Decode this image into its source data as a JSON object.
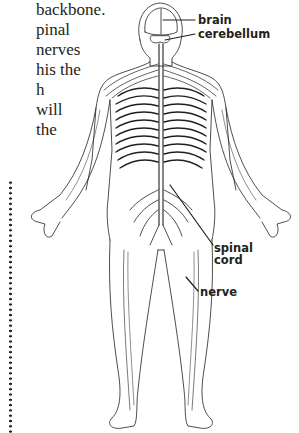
{
  "body_text": {
    "lines": [
      "backbone.",
      "pinal",
      "nerves",
      "his the",
      "h",
      "will",
      "the"
    ]
  },
  "diagram": {
    "labels": {
      "brain": "brain",
      "cerebellum": "cerebellum",
      "spinal_cord": "spinal\ncord",
      "spinal_cord_line1": "spinal",
      "spinal_cord_line2": "cord",
      "nerve": "nerve"
    }
  },
  "colors": {
    "ink": "#231f20",
    "background": "#ffffff"
  }
}
